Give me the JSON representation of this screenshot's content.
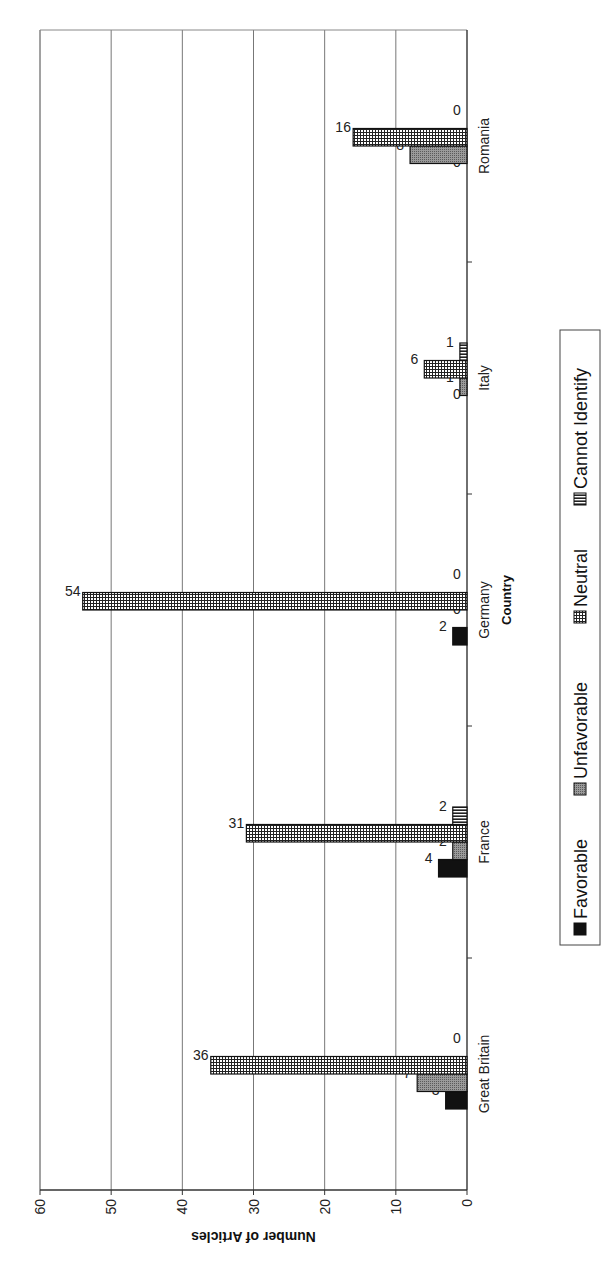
{
  "chart_data": {
    "type": "bar",
    "orientation_note": "figure rotated 90 degrees counter-clockwise on page",
    "title": "",
    "xlabel": "Country",
    "ylabel": "Number of Articles",
    "categories": [
      "Great Britain",
      "France",
      "Germany",
      "Italy",
      "Romania"
    ],
    "series": [
      {
        "name": "Favorable",
        "values": [
          3,
          4,
          2,
          0,
          0
        ],
        "fill": "#111111",
        "pattern": "solid"
      },
      {
        "name": "Unfavorable",
        "values": [
          7,
          2,
          0,
          1,
          8
        ],
        "fill": "#8a8a8a",
        "pattern": "dotted-gray"
      },
      {
        "name": "Neutral",
        "values": [
          36,
          31,
          54,
          6,
          16
        ],
        "fill": "#ffffff",
        "pattern": "grid"
      },
      {
        "name": "Cannot Identify",
        "values": [
          0,
          2,
          0,
          1,
          0
        ],
        "fill": "#555555",
        "pattern": "vertical-lines"
      }
    ],
    "ylim": [
      0,
      60
    ],
    "yticks": [
      0,
      10,
      20,
      30,
      40,
      50,
      60
    ],
    "grid": true,
    "legend_position": "bottom",
    "data_labels": true
  }
}
